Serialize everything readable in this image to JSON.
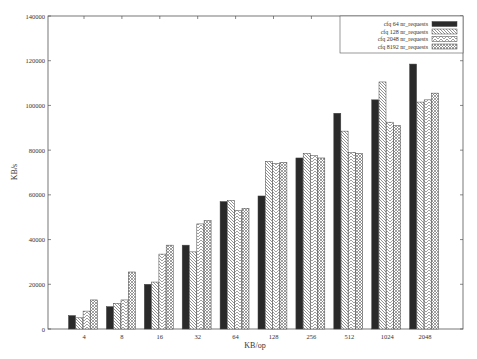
{
  "chart_data": {
    "type": "bar",
    "title": "",
    "xlabel": "KB/op",
    "ylabel": "KB/s",
    "ylim": [
      0,
      140000
    ],
    "yticks": [
      0,
      20000,
      40000,
      60000,
      80000,
      100000,
      120000,
      140000
    ],
    "grid": false,
    "legend_position": "top-right",
    "categories": [
      "4",
      "8",
      "16",
      "32",
      "64",
      "128",
      "256",
      "512",
      "1024",
      "2048"
    ],
    "series": [
      {
        "name": "cfq 64 nr_requests",
        "pattern": "solid-dark",
        "values": [
          6000,
          10000,
          20000,
          37500,
          57000,
          59500,
          76500,
          96500,
          102500,
          118500
        ]
      },
      {
        "name": "cfq 128 nr_requests",
        "pattern": "hatch-back",
        "values": [
          5000,
          11500,
          21000,
          34500,
          57500,
          75000,
          78500,
          88500,
          110500,
          101500
        ]
      },
      {
        "name": "cfq 2048 nr_requests",
        "pattern": "hatch-forward",
        "values": [
          8000,
          13000,
          33500,
          47000,
          53000,
          74000,
          77500,
          79000,
          92500,
          102500
        ]
      },
      {
        "name": "cfq 8192 nr_requests",
        "pattern": "crosshatch",
        "values": [
          13000,
          25500,
          37500,
          48500,
          54000,
          74500,
          76500,
          78500,
          91000,
          105500
        ]
      }
    ],
    "colors": {
      "axis": "#555555",
      "dark_bar": "#2a2a2a",
      "hatch": "#777777"
    }
  }
}
